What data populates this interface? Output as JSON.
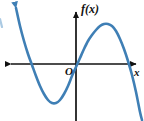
{
  "figure": {
    "background_color": "#ffffff",
    "width": 144,
    "height": 121
  },
  "labels": {
    "y_axis_label": "f(x)",
    "origin_label": "O",
    "x_axis_label": "x"
  },
  "colors": {
    "curve": "#3f7fb5",
    "curve_light": "#5b9bd0",
    "axis": "#111111"
  },
  "chart_data": {
    "type": "line",
    "xlabel": "x",
    "ylabel": "f(x)",
    "grid": false,
    "legend": null,
    "axes": {
      "x_axis_pixel_y": 64,
      "y_axis_pixel_x": 76,
      "x_axis_arrowheads": [
        "left",
        "right"
      ],
      "y_axis_arrowheads": [
        "top"
      ],
      "x_axis_pixel_range": [
        6,
        141
      ],
      "y_axis_pixel_range": [
        7,
        121
      ]
    },
    "curve": {
      "name": "f(x)",
      "shape": "cubic with negative leading coefficient",
      "arrowheads": [
        "top-left",
        "bottom-right"
      ],
      "features": [
        {
          "name": "x-intercept-left",
          "x_pixel": 22,
          "y_pixel": 64
        },
        {
          "name": "local-minimum",
          "x_pixel": 50,
          "y_pixel": 103
        },
        {
          "name": "x-intercept-middle",
          "x_pixel": 78,
          "y_pixel": 64
        },
        {
          "name": "local-maximum",
          "x_pixel": 108,
          "y_pixel": 25
        },
        {
          "name": "x-intercept-right",
          "x_pixel": 133,
          "y_pixel": 64
        }
      ],
      "points_pixel": [
        [
          16,
          8
        ],
        [
          20,
          26
        ],
        [
          24,
          41
        ],
        [
          28,
          54
        ],
        [
          32,
          65
        ],
        [
          36,
          76
        ],
        [
          40,
          86
        ],
        [
          44,
          94
        ],
        [
          48,
          100
        ],
        [
          52,
          103
        ],
        [
          56,
          103
        ],
        [
          60,
          100
        ],
        [
          64,
          94
        ],
        [
          68,
          86
        ],
        [
          72,
          76
        ],
        [
          76,
          67
        ],
        [
          80,
          58
        ],
        [
          84,
          49
        ],
        [
          88,
          41
        ],
        [
          92,
          35
        ],
        [
          96,
          30
        ],
        [
          100,
          26
        ],
        [
          104,
          24
        ],
        [
          108,
          24
        ],
        [
          112,
          26
        ],
        [
          116,
          31
        ],
        [
          120,
          39
        ],
        [
          124,
          49
        ],
        [
          128,
          61
        ],
        [
          132,
          75
        ],
        [
          136,
          92
        ],
        [
          140,
          112
        ],
        [
          142,
          120
        ]
      ]
    }
  }
}
